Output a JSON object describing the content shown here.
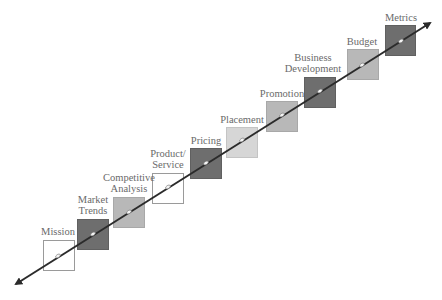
{
  "diagram": {
    "type": "staircase-process",
    "arrow": {
      "direction": "bidirectional-diagonal",
      "color": "#2b2b2b"
    },
    "steps": [
      {
        "label_line1": "Mission",
        "label_line2": "",
        "fill": "white"
      },
      {
        "label_line1": "Market",
        "label_line2": "Trends",
        "fill": "dark"
      },
      {
        "label_line1": "Competitive",
        "label_line2": "Analysis",
        "fill": "mid"
      },
      {
        "label_line1": "Product/",
        "label_line2": "Service",
        "fill": "white"
      },
      {
        "label_line1": "Pricing",
        "label_line2": "",
        "fill": "dark"
      },
      {
        "label_line1": "Placement",
        "label_line2": "",
        "fill": "light"
      },
      {
        "label_line1": "Promotion",
        "label_line2": "",
        "fill": "mid"
      },
      {
        "label_line1": "Business",
        "label_line2": "Development",
        "fill": "dark"
      },
      {
        "label_line1": "Budget",
        "label_line2": "",
        "fill": "mid"
      },
      {
        "label_line1": "Metrics",
        "label_line2": "",
        "fill": "dark"
      }
    ]
  }
}
